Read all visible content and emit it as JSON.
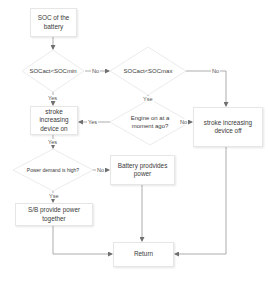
{
  "diagram": {
    "type": "flowchart",
    "nodes": {
      "start": {
        "label": "SOC of the battery",
        "shape": "rectangle"
      },
      "check_min": {
        "label": "SOCact<SOCmin",
        "shape": "diamond"
      },
      "check_max": {
        "label": "SOCact<SOCmax",
        "shape": "diamond"
      },
      "engine_recent": {
        "label": "Engine on at a moment ago?",
        "shape": "diamond"
      },
      "stroke_on": {
        "label": "stroke increasing device on",
        "shape": "rectangle"
      },
      "stroke_off": {
        "label": "stroke increasing device off",
        "shape": "rectangle"
      },
      "power_high": {
        "label": "Power demand is high?",
        "shape": "diamond"
      },
      "battery_power": {
        "label": "Battery prodvides power",
        "shape": "rectangle"
      },
      "sb_power": {
        "label": "S/B provide power together",
        "shape": "rectangle"
      },
      "return": {
        "label": "Return",
        "shape": "rectangle"
      }
    },
    "edge_labels": {
      "min_no": "No",
      "min_yes": "Yes",
      "max_no": "No",
      "max_yes": "Yse",
      "engine_yes": "Yes",
      "engine_no": "No",
      "stroke_on_yes": "Yes",
      "power_no": "No",
      "power_yes": "Yse"
    },
    "edges": [
      {
        "from": "start",
        "to": "check_min"
      },
      {
        "from": "check_min",
        "to": "check_max",
        "label": "No"
      },
      {
        "from": "check_min",
        "to": "stroke_on",
        "label": "Yes"
      },
      {
        "from": "check_max",
        "to": "stroke_off",
        "label": "No"
      },
      {
        "from": "check_max",
        "to": "engine_recent",
        "label": "Yse"
      },
      {
        "from": "engine_recent",
        "to": "stroke_on",
        "label": "Yes"
      },
      {
        "from": "engine_recent",
        "to": "stroke_off",
        "label": "No"
      },
      {
        "from": "stroke_on",
        "to": "power_high",
        "label": "Yes"
      },
      {
        "from": "power_high",
        "to": "battery_power",
        "label": "No"
      },
      {
        "from": "power_high",
        "to": "sb_power",
        "label": "Yse"
      },
      {
        "from": "sb_power",
        "to": "return"
      },
      {
        "from": "battery_power",
        "to": "return"
      },
      {
        "from": "stroke_off",
        "to": "return"
      }
    ],
    "colors": {
      "line": "#8a8a8a",
      "border": "#e6e6e6",
      "text": "#3a3a3a",
      "background": "#ffffff"
    }
  }
}
